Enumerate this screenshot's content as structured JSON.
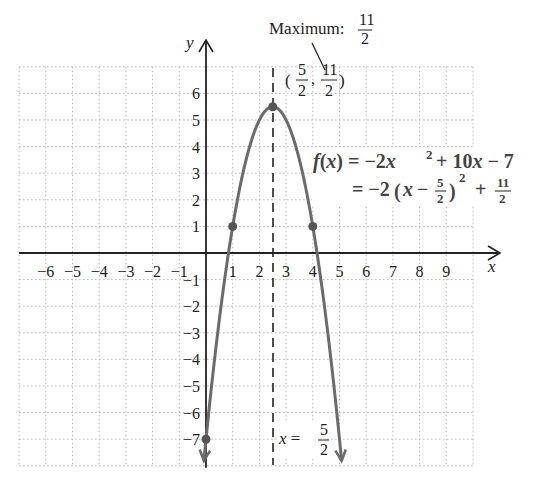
{
  "chart_data": {
    "type": "line",
    "title": "",
    "xlabel": "x",
    "ylabel": "y",
    "xlim": [
      -7,
      10
    ],
    "ylim": [
      -8,
      7
    ],
    "grid": true,
    "x_ticks": [
      "-6",
      "-5",
      "-4",
      "-3",
      "-2",
      "-1",
      "1",
      "2",
      "3",
      "4",
      "5",
      "6",
      "7",
      "8",
      "9"
    ],
    "y_ticks": [
      "6",
      "5",
      "4",
      "3",
      "2",
      "1",
      "-1",
      "-2",
      "-3",
      "-4",
      "-5",
      "-6",
      "-7"
    ],
    "function": "f(x) = -2x^2 + 10x - 7",
    "vertex_form": "= -2(x - 5/2)^2 + 11/2",
    "series": [
      {
        "name": "f(x) = -2x^2 + 10x - 7",
        "x": [
          -0.2,
          0,
          0.5,
          1,
          1.5,
          2,
          2.5,
          3,
          3.5,
          4,
          4.5,
          5,
          5.2
        ],
        "y": [
          -9.08,
          -7,
          -2.5,
          1,
          3.5,
          5,
          5.5,
          5,
          3.5,
          1,
          -2.5,
          -7,
          -9.08
        ]
      }
    ],
    "points": [
      {
        "x": 0,
        "y": -7
      },
      {
        "x": 1,
        "y": 1
      },
      {
        "x": 2.5,
        "y": 5.5
      },
      {
        "x": 4,
        "y": 1
      }
    ],
    "axis_of_symmetry": {
      "x": 2.5,
      "label": "x = 5/2"
    },
    "annotations": [
      {
        "text": "Maximum: 11/2",
        "target": {
          "x": 2.5,
          "y": 5.5
        }
      },
      {
        "text": "(5/2, 11/2)",
        "at": {
          "x": 2.5,
          "y": 5.5
        }
      },
      {
        "text": "x = 5/2",
        "at": "axis of symmetry, bottom"
      }
    ]
  },
  "labels": {
    "y_axis": "y",
    "x_axis": "x",
    "maximum_text": "Maximum:",
    "maximum_num": "11",
    "maximum_den": "2",
    "vertex_num_x": "5",
    "vertex_num_y": "11",
    "vertex_den": "2",
    "eq_line1": "f(x) = −2x",
    "eq_line1_exp": "2",
    "eq_line1_rest": " + 10x − 7",
    "eq_line2_a": "= −2(x − ",
    "eq_line2_fnum": "5",
    "eq_line2_fden": "2",
    "eq_line2_b": ")",
    "eq_line2_exp": "2",
    "eq_line2_c": " + ",
    "eq_line2_gnum": "11",
    "eq_line2_gden": "2",
    "axis_label_a": "x = ",
    "axis_label_num": "5",
    "axis_label_den": "2"
  },
  "colors": {
    "curve": "#6b6b6b",
    "axis": "#222222",
    "grid": "#b8b8b8",
    "point": "#555555"
  }
}
